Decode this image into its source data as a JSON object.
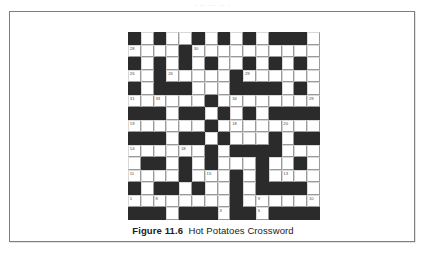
{
  "page": {
    "clipped_header_text": "·  ··      ···   ··  ·"
  },
  "figure": {
    "caption_label": "Figure 11.6",
    "caption_title": "Hot Potatoes Crossword"
  },
  "crossword": {
    "rows": 15,
    "cols": 15,
    "colors": {
      "block": "#2b2b2b",
      "cell": "#ffffff",
      "gridline": "#9a9a9a",
      "number": "#4a4a4a"
    },
    "grid": [
      "..#.#..#.#.#.##.",
      "....................",
      "",
      ""
    ],
    "pattern": [
      [
        1,
        0,
        1,
        0,
        0,
        1,
        0,
        1,
        0,
        1,
        0,
        1,
        1,
        1,
        0
      ],
      [
        0,
        0,
        0,
        0,
        1,
        0,
        0,
        0,
        0,
        0,
        0,
        0,
        0,
        0,
        0
      ],
      [
        1,
        0,
        1,
        0,
        1,
        0,
        1,
        0,
        0,
        1,
        0,
        1,
        0,
        1,
        0
      ],
      [
        0,
        0,
        1,
        0,
        0,
        0,
        0,
        0,
        1,
        0,
        0,
        0,
        0,
        0,
        0
      ],
      [
        1,
        0,
        1,
        1,
        1,
        0,
        0,
        0,
        1,
        1,
        1,
        1,
        0,
        1,
        0
      ],
      [
        0,
        0,
        0,
        0,
        0,
        0,
        1,
        0,
        0,
        0,
        0,
        0,
        0,
        0,
        0
      ],
      [
        1,
        1,
        1,
        0,
        1,
        1,
        0,
        1,
        0,
        1,
        0,
        1,
        1,
        1,
        1
      ],
      [
        0,
        0,
        0,
        0,
        0,
        0,
        1,
        0,
        0,
        0,
        0,
        0,
        0,
        0,
        0
      ],
      [
        1,
        1,
        1,
        0,
        1,
        1,
        0,
        1,
        0,
        0,
        0,
        1,
        0,
        1,
        1
      ],
      [
        0,
        0,
        0,
        0,
        0,
        0,
        1,
        0,
        1,
        1,
        1,
        1,
        0,
        0,
        0
      ],
      [
        0,
        1,
        1,
        0,
        1,
        0,
        1,
        0,
        0,
        0,
        1,
        0,
        0,
        1,
        0
      ],
      [
        0,
        0,
        0,
        0,
        1,
        0,
        0,
        0,
        1,
        0,
        1,
        0,
        0,
        0,
        0
      ],
      [
        1,
        0,
        1,
        1,
        0,
        1,
        0,
        0,
        1,
        0,
        1,
        1,
        1,
        1,
        0
      ],
      [
        0,
        0,
        0,
        0,
        0,
        0,
        0,
        0,
        1,
        0,
        0,
        0,
        0,
        0,
        0
      ],
      [
        1,
        1,
        1,
        0,
        1,
        1,
        1,
        0,
        1,
        1,
        0,
        1,
        1,
        1,
        1
      ]
    ],
    "numbers": [
      {
        "row": 1,
        "col": 0,
        "label": "28"
      },
      {
        "row": 1,
        "col": 5,
        "label": "30"
      },
      {
        "row": 3,
        "col": 0,
        "label": "26"
      },
      {
        "row": 3,
        "col": 3,
        "label": "26"
      },
      {
        "row": 3,
        "col": 9,
        "label": "29"
      },
      {
        "row": 5,
        "col": 0,
        "label": "31"
      },
      {
        "row": 5,
        "col": 2,
        "label": "33"
      },
      {
        "row": 5,
        "col": 6,
        "label": "23"
      },
      {
        "row": 5,
        "col": 8,
        "label": "34"
      },
      {
        "row": 5,
        "col": 14,
        "label": "29"
      },
      {
        "row": 7,
        "col": 0,
        "label": "19"
      },
      {
        "row": 7,
        "col": 8,
        "label": "18"
      },
      {
        "row": 7,
        "col": 12,
        "label": "20"
      },
      {
        "row": 9,
        "col": 0,
        "label": "14"
      },
      {
        "row": 9,
        "col": 4,
        "label": "18"
      },
      {
        "row": 9,
        "col": 8,
        "label": "18"
      },
      {
        "row": 9,
        "col": 10,
        "label": "15"
      },
      {
        "row": 11,
        "col": 0,
        "label": "11"
      },
      {
        "row": 11,
        "col": 6,
        "label": "15"
      },
      {
        "row": 11,
        "col": 12,
        "label": "13"
      },
      {
        "row": 13,
        "col": 0,
        "label": "1"
      },
      {
        "row": 13,
        "col": 2,
        "label": "8"
      },
      {
        "row": 13,
        "col": 10,
        "label": "9"
      },
      {
        "row": 13,
        "col": 14,
        "label": "10"
      },
      {
        "row": 14,
        "col": 0,
        "label": "1"
      },
      {
        "row": 14,
        "col": 4,
        "label": "2"
      },
      {
        "row": 14,
        "col": 5,
        "label": "2"
      },
      {
        "row": 14,
        "col": 7,
        "label": "3"
      },
      {
        "row": 14,
        "col": 9,
        "label": "4"
      },
      {
        "row": 14,
        "col": 10,
        "label": "5"
      },
      {
        "row": 14,
        "col": 12,
        "label": "6"
      }
    ]
  }
}
